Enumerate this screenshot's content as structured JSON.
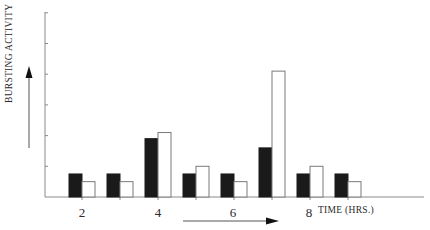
{
  "chart_data": {
    "type": "bar",
    "title": "",
    "xlabel": "TIME (HRS.)",
    "ylabel": "BURSTING ACTIVITY",
    "x_tick_labels": [
      "2",
      "4",
      "6",
      "8"
    ],
    "categories": [
      "g1",
      "g2",
      "g3",
      "g4",
      "g5",
      "g6",
      "g7",
      "g8"
    ],
    "series": [
      {
        "name": "black",
        "color": "#1a1a1a",
        "values": [
          0.75,
          0.75,
          1.9,
          0.75,
          0.75,
          1.6,
          0.75,
          0.75
        ]
      },
      {
        "name": "white",
        "color": "#ffffff",
        "values": [
          0.5,
          0.5,
          2.1,
          1.0,
          0.5,
          4.1,
          1.0,
          0.5
        ]
      }
    ],
    "ylim": [
      0,
      6
    ],
    "y_ticks": [
      1,
      2,
      3,
      4,
      5,
      6
    ],
    "y_tick_labels_shown": false,
    "grid": false,
    "legend": "none",
    "annotations": [
      "up arrow beside y-axis label",
      "right arrow below x-axis"
    ]
  },
  "labels": {
    "ylabel": "BURSTING ACTIVITY",
    "xlabel": "TIME (HRS.)",
    "xticks": [
      {
        "text": "2",
        "x": 82
      },
      {
        "text": "4",
        "x": 158
      },
      {
        "text": "6",
        "x": 233
      },
      {
        "text": "8",
        "x": 309
      }
    ]
  }
}
